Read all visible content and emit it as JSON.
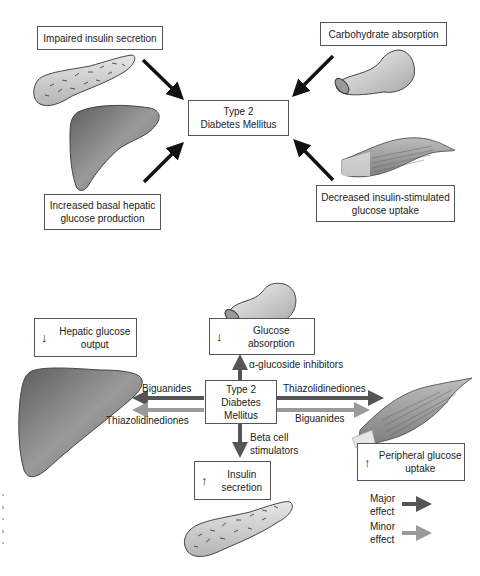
{
  "top_panel": {
    "center": {
      "line1": "Type 2",
      "line2": "Diabetes Mellitus"
    },
    "factors": [
      {
        "id": "pancreas",
        "label": "Impaired insulin secretion"
      },
      {
        "id": "intestine",
        "label": "Carbohydrate absorption"
      },
      {
        "id": "liver",
        "label_line1": "Increased basal hepatic",
        "label_line2": "glucose production"
      },
      {
        "id": "muscle",
        "label_line1": "Decreased insulin-stimulated",
        "label_line2": "glucose uptake"
      }
    ]
  },
  "bottom_panel": {
    "center": {
      "line1": "Type 2",
      "line2": "Diabetes",
      "line3": "Mellitus"
    },
    "effects": {
      "hepatic": {
        "arrow": "↓",
        "line1": "Hepatic glucose",
        "line2": "output"
      },
      "absorption": {
        "arrow": "↓",
        "line1": "Glucose absorption"
      },
      "insulin": {
        "arrow": "↑",
        "line1": "Insulin",
        "line2": "secretion"
      },
      "peripheral": {
        "arrow": "↑",
        "line1": "Peripheral glucose",
        "line2": "uptake"
      }
    },
    "drugs": {
      "alpha_glucosidase": "α-glucoside inhibitors",
      "biguanides_left": "Biguanides",
      "thiazolidinediones_left": "Thiazolidinediones",
      "thiazolidinediones_right": "Thiazolidinediones",
      "biguanides_right": "Biguanides",
      "beta_cell_line1": "Beta cell",
      "beta_cell_line2": "stimulators"
    },
    "legend": {
      "major_line1": "Major",
      "major_line2": "effect",
      "minor_line1": "Minor",
      "minor_line2": "effect"
    }
  },
  "colors": {
    "major_arrow": "#555555",
    "minor_arrow": "#9a9a9a",
    "black_arrow": "#111111",
    "organ_fill": "#8c8c8c"
  }
}
